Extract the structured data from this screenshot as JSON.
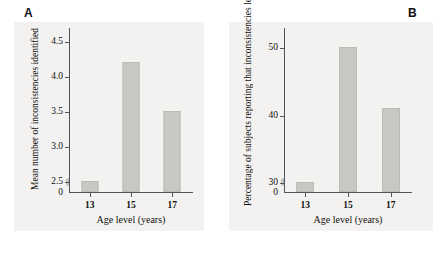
{
  "figure": {
    "panel_letters": {
      "a": "A",
      "b": "B"
    },
    "background_color": "#f3f2f0",
    "bar_color": "#c9c7c4",
    "axis_color": "#555555",
    "break_symbol": "//"
  },
  "chart_data": [
    {
      "type": "bar",
      "panel": "A",
      "title": "",
      "categories": [
        "13",
        "15",
        "17"
      ],
      "values": [
        2.5,
        4.2,
        3.5
      ],
      "xlabel": "Age level (years)",
      "ylabel": "Mean number of inconsistencies identified",
      "ylabel_lines": [
        "Mean number of inconsistencies",
        "identified"
      ],
      "ytick_labels": [
        "0",
        "2.5",
        "3.0",
        "3.5",
        "4.0",
        "4.5"
      ],
      "ytick_values": [
        0,
        2.5,
        3.0,
        3.5,
        4.0,
        4.5
      ],
      "ylim": [
        2.35,
        4.7
      ],
      "axis_break": true,
      "grid": false,
      "legend": "none"
    },
    {
      "type": "bar",
      "panel": "B",
      "title": "",
      "categories": [
        "13",
        "15",
        "17"
      ],
      "values": [
        30,
        50,
        41
      ],
      "xlabel": "Age level (years)",
      "ylabel": "Percentage of subjects reporting that inconsistencies led to confusion",
      "ylabel_lines": [
        "Percentage of subjects reporting",
        "that inconsistencies led to confusion"
      ],
      "ytick_labels": [
        "0",
        "30",
        "40",
        "50"
      ],
      "ytick_values": [
        0,
        30,
        40,
        50
      ],
      "ylim": [
        28.5,
        53
      ],
      "axis_break": true,
      "grid": false,
      "legend": "none"
    }
  ]
}
